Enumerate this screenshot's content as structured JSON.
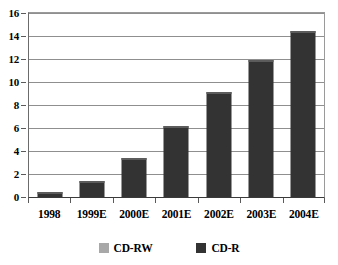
{
  "chart_data": {
    "type": "bar",
    "title": "",
    "xlabel": "",
    "ylabel": "",
    "categories": [
      "1998",
      "1999E",
      "2000E",
      "2001E",
      "2002E",
      "2003E",
      "2004E"
    ],
    "series": [
      {
        "name": "CD-RW",
        "color": "#a8a8a8",
        "values": [
          0,
          0,
          0,
          0,
          0,
          0,
          0
        ]
      },
      {
        "name": "CD-R",
        "color": "#333333",
        "values": [
          0.4,
          1.35,
          3.4,
          6.2,
          9.1,
          11.9,
          14.4
        ]
      }
    ],
    "ylim": [
      0,
      16
    ],
    "yticks": [
      0,
      2,
      4,
      6,
      8,
      10,
      12,
      14,
      16
    ],
    "ytick_labels": [
      "0",
      "2",
      "4",
      "6",
      "8",
      "10",
      "12",
      "14",
      "16"
    ],
    "grid": true,
    "legend_position": "bottom"
  },
  "legend": {
    "entries": [
      {
        "label": "CD-RW",
        "color": "#a8a8a8"
      },
      {
        "label": "CD-R",
        "color": "#333333"
      }
    ]
  }
}
